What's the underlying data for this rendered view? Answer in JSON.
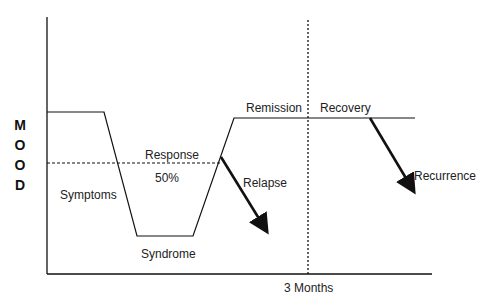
{
  "diagram": {
    "y_axis_label": [
      "M",
      "O",
      "O",
      "D"
    ],
    "x_axis_label": "3 Months",
    "labels": {
      "symptoms": "Symptoms",
      "response": "Response",
      "response_threshold": "50%",
      "syndrome": "Syndrome",
      "relapse": "Relapse",
      "remission": "Remission",
      "recovery": "Recovery",
      "recurrence": "Recurrence"
    },
    "colors": {
      "line": "#111111",
      "text": "#222222",
      "background": "#ffffff"
    }
  }
}
